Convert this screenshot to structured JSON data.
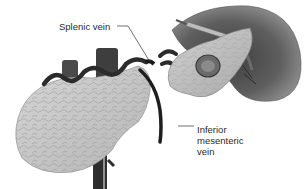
{
  "figure": {
    "style": "grayscale",
    "labels": {
      "splenic_vein": "Splenic vein",
      "inferior_mesenteric_vein": [
        "Inferior",
        "mesenteric",
        "vein"
      ]
    },
    "structures": [
      {
        "name": "pancreas",
        "icon": "pancreas-shape"
      },
      {
        "name": "spleen",
        "icon": "spleen-shape"
      },
      {
        "name": "resected-pancreatic-tail",
        "icon": "tissue-flap-shape"
      },
      {
        "name": "splenic-vein",
        "icon": "vein-path"
      },
      {
        "name": "inferior-mesenteric-vein",
        "icon": "vein-path"
      },
      {
        "name": "portal-vessels",
        "icon": "vessel-column"
      },
      {
        "name": "surgical-instrument",
        "icon": "probe-shape"
      }
    ],
    "colors": {
      "background": "#ffffff",
      "pancreas": "#c8c8c8",
      "spleen": "#6e6e6e",
      "vein": "#2b2b2b",
      "label_text": "#2a2a2a"
    }
  }
}
